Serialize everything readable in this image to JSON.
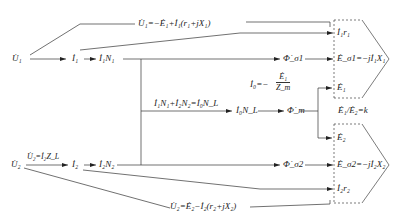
{
  "diagram": {
    "type": "transformer signal-flow diagram",
    "nodes": {
      "U1": "U̇₁",
      "I1": "İ₁",
      "I1N1": "İ₁N₁",
      "U2": "U̇₂",
      "U2_eq": "U̇₂=İ₂Z_L",
      "I2": "İ₂",
      "I2N2": "İ₂N₂",
      "mmf_balance": "İ₁N₁+İ₂N₂=İ₀N_L",
      "I0NL": "İ₀N_L",
      "Phi_m": "Φ̇_m",
      "Phi_s1": "Φ̇_σ1",
      "Phi_s2": "Φ̇_σ2",
      "I0_label": "İ₀=−",
      "I0_num": "Ė₁",
      "I0_den": "Z_m",
      "U1_eq": "U̇₁=−Ė₁+İ₁(r₁+jX₁)",
      "U2_eq_bottom": "U̇₂=Ė₂−İ₂(r₂+jX₂)",
      "I1r1": "İ₁r₁",
      "Es1": "Ė_σ1=−jİ₁X₁",
      "E1": "Ė₁",
      "ratio": "Ė₁/Ė₂=k",
      "E2": "Ė₂",
      "Es2": "Ė_σ2=−jİ₂X₂",
      "I2r2": "İ₂r₂"
    },
    "groups": [
      {
        "name": "primary-voltage-sum",
        "members": [
          "I1r1",
          "Es1",
          "E1"
        ]
      },
      {
        "name": "secondary-voltage-sum",
        "members": [
          "E2",
          "Es2",
          "I2r2"
        ]
      }
    ]
  }
}
